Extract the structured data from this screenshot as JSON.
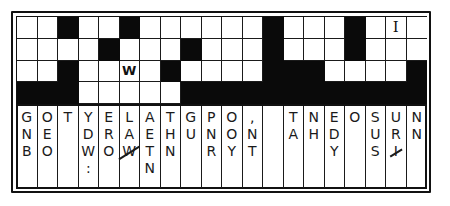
{
  "puzzle": {
    "type": "quote-falls (fallen phrase) puzzle",
    "columns": 20,
    "rows": 4,
    "grid": [
      [
        "",
        "",
        "#",
        "",
        "",
        "#",
        "",
        "",
        "",
        "",
        "",
        "",
        "#",
        "",
        "",
        "",
        "#",
        "",
        "I",
        ""
      ],
      [
        "",
        "",
        "",
        "",
        "#",
        "",
        "",
        "",
        "#",
        "",
        "",
        "",
        "#",
        "",
        "",
        "",
        "#",
        "",
        "",
        ""
      ],
      [
        "",
        "",
        "#",
        "",
        "",
        "W",
        "",
        "#",
        "",
        "",
        "",
        "",
        "#",
        "#",
        "#",
        "",
        "",
        "",
        "",
        "#"
      ],
      [
        "#",
        "#",
        "#",
        "",
        "",
        "",
        "",
        "",
        "#",
        "#",
        "#",
        "#",
        "#",
        "#",
        "#",
        "#",
        "#",
        "#",
        "#",
        "#"
      ]
    ],
    "clue_columns": [
      {
        "letters": [
          {
            "ch": "G"
          },
          {
            "ch": "N"
          },
          {
            "ch": "B"
          }
        ]
      },
      {
        "letters": [
          {
            "ch": "O"
          },
          {
            "ch": "E"
          },
          {
            "ch": "O"
          }
        ]
      },
      {
        "letters": [
          {
            "ch": "T"
          }
        ]
      },
      {
        "letters": [
          {
            "ch": "Y"
          },
          {
            "ch": "D"
          },
          {
            "ch": "W"
          },
          {
            "ch": ":"
          }
        ]
      },
      {
        "letters": [
          {
            "ch": "E"
          },
          {
            "ch": "R"
          },
          {
            "ch": "O"
          }
        ]
      },
      {
        "letters": [
          {
            "ch": "L"
          },
          {
            "ch": "A"
          },
          {
            "ch": "W",
            "crossed": true
          }
        ]
      },
      {
        "letters": [
          {
            "ch": "A"
          },
          {
            "ch": "E"
          },
          {
            "ch": "T"
          },
          {
            "ch": "N"
          }
        ]
      },
      {
        "letters": [
          {
            "ch": "T"
          },
          {
            "ch": "H"
          },
          {
            "ch": "N"
          }
        ]
      },
      {
        "letters": [
          {
            "ch": "G"
          },
          {
            "ch": "U"
          }
        ]
      },
      {
        "letters": [
          {
            "ch": "P"
          },
          {
            "ch": "N"
          },
          {
            "ch": "R"
          }
        ]
      },
      {
        "letters": [
          {
            "ch": "O"
          },
          {
            "ch": "O"
          },
          {
            "ch": "Y"
          }
        ]
      },
      {
        "letters": [
          {
            "ch": ","
          },
          {
            "ch": "N"
          },
          {
            "ch": "T"
          }
        ]
      },
      {
        "letters": []
      },
      {
        "letters": [
          {
            "ch": "T"
          },
          {
            "ch": "A"
          }
        ]
      },
      {
        "letters": [
          {
            "ch": "N"
          },
          {
            "ch": "H"
          }
        ]
      },
      {
        "letters": [
          {
            "ch": "E"
          },
          {
            "ch": "D"
          },
          {
            "ch": "Y"
          }
        ]
      },
      {
        "letters": [
          {
            "ch": "O"
          }
        ]
      },
      {
        "letters": [
          {
            "ch": "S"
          },
          {
            "ch": "U"
          },
          {
            "ch": "S"
          }
        ]
      },
      {
        "letters": [
          {
            "ch": "U"
          },
          {
            "ch": "R"
          },
          {
            "ch": "I",
            "crossed": true
          }
        ]
      },
      {
        "letters": [
          {
            "ch": "N"
          },
          {
            "ch": "N"
          }
        ]
      }
    ]
  },
  "colors": {
    "ink": "#111111",
    "paper": "#ffffff"
  }
}
